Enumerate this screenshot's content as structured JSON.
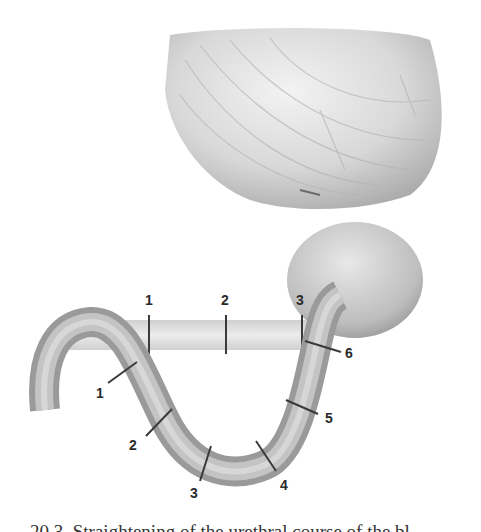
{
  "figure": {
    "straight_urethra_labels": [
      "1",
      "2",
      "3"
    ],
    "curved_urethra_labels": [
      "1",
      "2",
      "3",
      "4",
      "5",
      "6"
    ],
    "colors": {
      "tissue_light": "#e6e6e6",
      "tissue_mid": "#bdbdbd",
      "tissue_dark": "#8f8f8f",
      "marker": "#3a3a3a",
      "label": "#2a2a2a"
    }
  },
  "caption": "20.3. Straightening of the urethral course of the bl"
}
